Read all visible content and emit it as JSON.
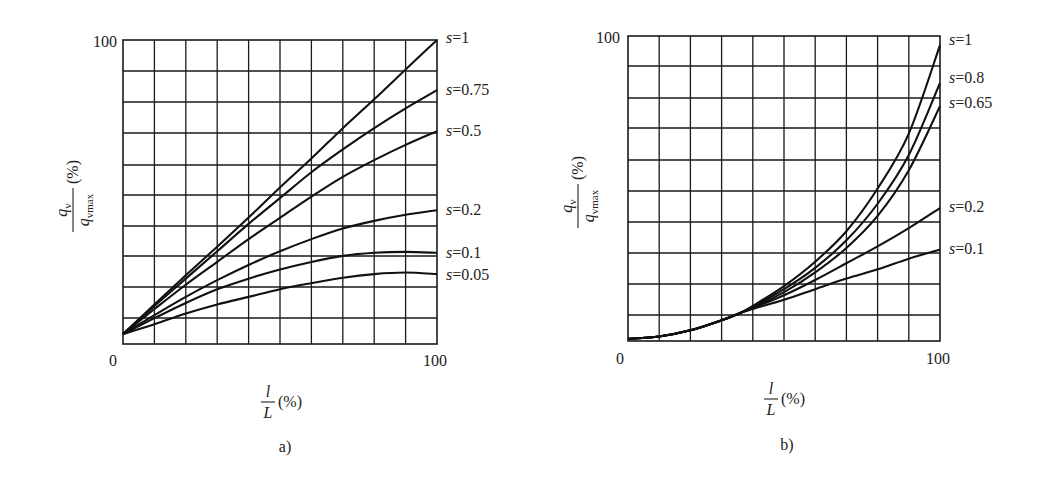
{
  "figure": {
    "panels": [
      "a)",
      "b)"
    ]
  },
  "chart_data": [
    {
      "type": "line",
      "panel_caption": "a)",
      "title": "",
      "xlabel": "l/L (%)",
      "ylabel": "q_v / q_vmax (%)",
      "xlim": [
        0,
        100
      ],
      "ylim": [
        0,
        100
      ],
      "x_tick_labels": [
        "0",
        "100"
      ],
      "y_tick_labels": [
        "100"
      ],
      "grid": true,
      "grid_divisions": {
        "x": 10,
        "y": 10
      },
      "legend_position": "inline-right",
      "series": [
        {
          "name": "s=1",
          "x": [
            0,
            10,
            20,
            30,
            40,
            50,
            60,
            70,
            80,
            90,
            100
          ],
          "y": [
            3.3,
            13,
            22.6,
            32,
            41.6,
            51.5,
            61,
            71,
            80.5,
            90.3,
            100
          ]
        },
        {
          "name": "s=0.75",
          "x": [
            0,
            10,
            20,
            30,
            40,
            50,
            60,
            70,
            80,
            90,
            100
          ],
          "y": [
            3.3,
            12.5,
            21.5,
            30.5,
            39.5,
            48,
            56.5,
            64,
            71,
            77.5,
            83.5
          ]
        },
        {
          "name": "s=0.5",
          "x": [
            0,
            10,
            20,
            30,
            40,
            50,
            60,
            70,
            80,
            90,
            100
          ],
          "y": [
            3.3,
            11.5,
            19.5,
            27,
            34.5,
            41.5,
            48.5,
            55,
            60.5,
            65.5,
            70
          ]
        },
        {
          "name": "s=0.2",
          "x": [
            0,
            10,
            20,
            30,
            40,
            50,
            60,
            70,
            80,
            90,
            100
          ],
          "y": [
            3.3,
            9.5,
            15.5,
            21,
            26,
            30.5,
            34.5,
            38,
            40.5,
            42.5,
            44
          ]
        },
        {
          "name": "s=0.1",
          "x": [
            0,
            10,
            20,
            30,
            40,
            50,
            60,
            70,
            80,
            90,
            100
          ],
          "y": [
            3.3,
            8.5,
            13.5,
            18,
            21.5,
            24.5,
            27,
            29,
            30,
            30.3,
            30
          ]
        },
        {
          "name": "s=0.05",
          "x": [
            0,
            10,
            20,
            30,
            40,
            50,
            60,
            70,
            80,
            90,
            100
          ],
          "y": [
            3.3,
            6.5,
            10,
            13,
            15.5,
            18,
            20,
            21.8,
            23,
            23.5,
            23
          ]
        }
      ]
    },
    {
      "type": "line",
      "panel_caption": "b)",
      "title": "",
      "xlabel": "l/L (%)",
      "ylabel": "q_v / q_vmax (%)",
      "xlim": [
        0,
        100
      ],
      "ylim": [
        0,
        100
      ],
      "x_tick_labels": [
        "0",
        "100"
      ],
      "y_tick_labels": [
        "100"
      ],
      "grid": true,
      "grid_divisions": {
        "x": 10,
        "y": 10
      },
      "legend_position": "inline-right",
      "series": [
        {
          "name": "s=1",
          "x": [
            0,
            10,
            20,
            30,
            36,
            40,
            50,
            60,
            70,
            80,
            90,
            100
          ],
          "y": [
            0.7,
            1.5,
            3.5,
            6.8,
            9.2,
            11.5,
            18,
            26,
            36,
            50,
            68,
            97
          ]
        },
        {
          "name": "s=0.8",
          "x": [
            0,
            10,
            20,
            30,
            36,
            40,
            50,
            60,
            70,
            80,
            90,
            100
          ],
          "y": [
            0.7,
            1.5,
            3.5,
            6.8,
            9.2,
            11.2,
            17,
            24,
            33,
            45,
            61,
            84.6
          ]
        },
        {
          "name": "s=0.65",
          "x": [
            0,
            10,
            20,
            30,
            36,
            40,
            50,
            60,
            70,
            80,
            90,
            100
          ],
          "y": [
            0.7,
            1.5,
            3.5,
            6.8,
            9.2,
            11,
            16,
            22.5,
            30.5,
            41,
            56,
            77
          ]
        },
        {
          "name": "s=0.2",
          "x": [
            0,
            10,
            20,
            30,
            36,
            40,
            50,
            60,
            70,
            80,
            90,
            100
          ],
          "y": [
            0.7,
            1.5,
            3.5,
            6.8,
            9.2,
            10.8,
            15,
            20,
            25.5,
            31,
            37,
            43.6
          ]
        },
        {
          "name": "s=0.1",
          "x": [
            0,
            10,
            20,
            30,
            36,
            40,
            50,
            60,
            70,
            80,
            90,
            100
          ],
          "y": [
            0.7,
            1.5,
            3.5,
            6.8,
            9.2,
            10.5,
            13.5,
            17,
            20.5,
            23.5,
            27,
            30
          ]
        }
      ]
    }
  ],
  "labels": {
    "a": {
      "y_top": "100",
      "x_left": "0",
      "x_right": "100",
      "caption": "a)",
      "series_labels": [
        "s=1",
        "s=0.75",
        "s=0.5",
        "s=0.2",
        "s=0.1",
        "s=0.05"
      ]
    },
    "b": {
      "y_top": "100",
      "x_left": "0",
      "x_right": "100",
      "caption": "b)",
      "series_labels": [
        "s=1",
        "s=0.8",
        "s=0.65",
        "s=0.2",
        "s=0.1"
      ]
    },
    "axis": {
      "y_num": "q",
      "y_num_sub": "v",
      "y_den": "q",
      "y_den_sub": "vmax",
      "y_unit": "(%)",
      "x_num": "l",
      "x_den": "L",
      "x_unit": "(%)"
    }
  }
}
